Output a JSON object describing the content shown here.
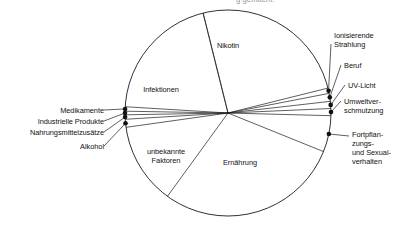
{
  "figure": {
    "title_cropped": "g gemacht.",
    "kind": "pie-diagram"
  },
  "chart_data": {
    "type": "pie",
    "title": "g gemacht.",
    "subtitle": "",
    "xlabel": "",
    "ylabel": "",
    "legend_position": "none",
    "grid": false,
    "units": "percent of cancer deaths (approx. share of circle)",
    "note": "Circle of cancer risk factors; large wedges labelled inside, thin wedges labelled outside with leader lines and dot markers on the arc.",
    "categories": [
      "Nikotin",
      "Ernährung",
      "Infektionen",
      "unbekannte Faktoren",
      "Fortpflanzungs- und Sexualverhalten",
      "Umweltverschmutzung",
      "UV-Licht",
      "Beruf",
      "Ionisierende Strahlung",
      "Alkohol",
      "Nahrungsmittelzusätze",
      "Industrielle Produkte",
      "Medikamente"
    ],
    "values": [
      30,
      32,
      10,
      12,
      6,
      2,
      2,
      2,
      1.5,
      1.5,
      0.6,
      0.6,
      0.8
    ],
    "slices": [
      {
        "label": "Nikotin",
        "value": 30,
        "start_deg": -104,
        "end_deg": -14,
        "label_pos": "inside",
        "dot": false
      },
      {
        "label": "Ionisierende Strahlung",
        "value": 1.5,
        "start_deg": -14,
        "end_deg": -11,
        "label_pos": "outside-right",
        "dot": true
      },
      {
        "label": "Beruf",
        "value": 2,
        "start_deg": -11,
        "end_deg": -6.5,
        "label_pos": "outside-right",
        "dot": true
      },
      {
        "label": "UV-Licht",
        "value": 2,
        "start_deg": -6.5,
        "end_deg": -2.5,
        "label_pos": "outside-right",
        "dot": true
      },
      {
        "label": "Umweltverschmutzung",
        "value": 2,
        "start_deg": -2.5,
        "end_deg": 1.5,
        "label_pos": "outside-right",
        "dot": true
      },
      {
        "label": "Fortpflanzungs- und Sexualverhalten",
        "value": 6,
        "start_deg": 1.5,
        "end_deg": 22,
        "label_pos": "outside-right",
        "dot": true
      },
      {
        "label": "Ernährung",
        "value": 32,
        "start_deg": 22,
        "end_deg": 126,
        "label_pos": "inside",
        "dot": false
      },
      {
        "label": "unbekannte Faktoren",
        "value": 12,
        "start_deg": 126,
        "end_deg": 172,
        "label_pos": "inside",
        "dot": false
      },
      {
        "label": "Alkohol",
        "value": 1.5,
        "start_deg": 172,
        "end_deg": 176.5,
        "label_pos": "outside-left",
        "dot": true
      },
      {
        "label": "Nahrungsmittelzusätze",
        "value": 0.6,
        "start_deg": 176.5,
        "end_deg": 179,
        "label_pos": "outside-left",
        "dot": true
      },
      {
        "label": "Industrielle Produkte",
        "value": 0.6,
        "start_deg": 179,
        "end_deg": 181,
        "label_pos": "outside-left",
        "dot": true
      },
      {
        "label": "Medikamente",
        "value": 0.8,
        "start_deg": 181,
        "end_deg": 183.5,
        "label_pos": "outside-left",
        "dot": true
      },
      {
        "label": "Infektionen",
        "value": 10,
        "start_deg": 183.5,
        "end_deg": 256,
        "label_pos": "inside",
        "dot": false
      }
    ]
  },
  "inside_labels": [
    {
      "text": "Nikotin"
    },
    {
      "text": "Infektionen"
    },
    {
      "text": "unbekannte"
    },
    {
      "text": "Faktoren"
    },
    {
      "text": "Ernährung"
    }
  ],
  "left_labels": [
    {
      "text": "Medikamente"
    },
    {
      "text": "Industrielle Produkte"
    },
    {
      "text": "Nahrungsmittelzusätze"
    },
    {
      "text": "Alkohol"
    }
  ],
  "right_labels": [
    {
      "line1": "Ionisierende",
      "line2": "Strahlung"
    },
    {
      "line1": "Beruf",
      "line2": ""
    },
    {
      "line1": "UV-Licht",
      "line2": ""
    },
    {
      "line1": "Umweltver-",
      "line2": "schmutzung"
    },
    {
      "line1": "Fortpflan-",
      "line2": "zungs-",
      "line3": "und Sexual-",
      "line4": "verhalten"
    }
  ],
  "colors": {
    "stroke": "#1a1a1a",
    "shadow": "#a9a9a9",
    "dot": "#111111",
    "background": "#ffffff",
    "text": "#111111"
  }
}
